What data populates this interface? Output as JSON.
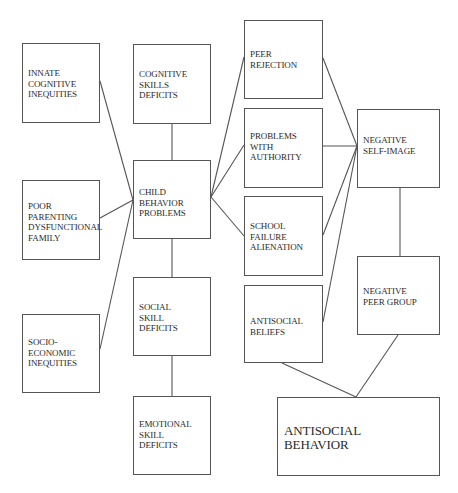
{
  "diagram": {
    "title": "",
    "line_color": "#555555",
    "text_color": "#2a2a2a",
    "nodes": [
      {
        "id": "innate",
        "label": "INNATE\nCOGNITIVE\nINEQUITIES",
        "x": 22,
        "y": 43,
        "w": 78,
        "h": 80,
        "label_top": 24
      },
      {
        "id": "cognitive",
        "label": "COGNITIVE\nSKILLS\nDEFICITS",
        "x": 133,
        "y": 44,
        "w": 78,
        "h": 80,
        "label_top": 24
      },
      {
        "id": "child",
        "label": "CHILD\nBEHAVIOR\nPROBLEMS",
        "x": 133,
        "y": 160,
        "w": 78,
        "h": 79,
        "label_top": 26
      },
      {
        "id": "parenting",
        "label": "POOR\nPARENTING\nDYSFUNCTIONAL\nFAMILY",
        "x": 22,
        "y": 180,
        "w": 78,
        "h": 80,
        "label_top": 20
      },
      {
        "id": "social",
        "label": "SOCIAL\nSKILL\nDEFICITS",
        "x": 133,
        "y": 277,
        "w": 78,
        "h": 79,
        "label_top": 24
      },
      {
        "id": "socio",
        "label": "SOCIO-\nECONOMIC\nINEQUITIES",
        "x": 22,
        "y": 314,
        "w": 78,
        "h": 79,
        "label_top": 22
      },
      {
        "id": "emotional",
        "label": "EMOTIONAL\nSKILL\nDEFICITS",
        "x": 133,
        "y": 396,
        "w": 78,
        "h": 79,
        "label_top": 22
      },
      {
        "id": "peer_rejection",
        "label": "PEER\nREJECTION",
        "x": 244,
        "y": 20,
        "w": 79,
        "h": 79,
        "label_top": 28
      },
      {
        "id": "authority",
        "label": "PROBLEMS\nWITH\nAUTHORITY",
        "x": 244,
        "y": 108,
        "w": 79,
        "h": 80,
        "label_top": 22
      },
      {
        "id": "school",
        "label": "SCHOOL\nFAILURE\nALIENATION",
        "x": 244,
        "y": 196,
        "w": 79,
        "h": 80,
        "label_top": 24
      },
      {
        "id": "beliefs",
        "label": "ANTISOCIAL\nBELIEFS",
        "x": 244,
        "y": 285,
        "w": 79,
        "h": 78,
        "label_top": 30
      },
      {
        "id": "self_image",
        "label": "NEGATIVE\nSELF-IMAGE",
        "x": 357,
        "y": 109,
        "w": 83,
        "h": 79,
        "label_top": 25
      },
      {
        "id": "peer_group",
        "label": "NEGATIVE\nPEER GROUP",
        "x": 357,
        "y": 256,
        "w": 83,
        "h": 79,
        "label_top": 29
      },
      {
        "id": "behavior",
        "label": "ANTISOCIAL\nBEHAVIOR",
        "x": 277,
        "y": 397,
        "w": 163,
        "h": 79,
        "label_top": 26,
        "big": true
      }
    ],
    "edges": [
      {
        "from": "innate",
        "to": "child",
        "x1": 100,
        "y1": 81,
        "x2": 133,
        "y2": 200
      },
      {
        "from": "parenting",
        "to": "child",
        "x1": 100,
        "y1": 218,
        "x2": 133,
        "y2": 200
      },
      {
        "from": "socio",
        "to": "child",
        "x1": 100,
        "y1": 349,
        "x2": 133,
        "y2": 200
      },
      {
        "from": "cognitive",
        "to": "child",
        "x1": 172,
        "y1": 124,
        "x2": 172,
        "y2": 160
      },
      {
        "from": "child",
        "to": "social",
        "x1": 172,
        "y1": 239,
        "x2": 172,
        "y2": 277
      },
      {
        "from": "social",
        "to": "emotional",
        "x1": 172,
        "y1": 356,
        "x2": 172,
        "y2": 396
      },
      {
        "from": "child",
        "to": "peer_rejection",
        "x1": 211,
        "y1": 197,
        "x2": 244,
        "y2": 57
      },
      {
        "from": "child",
        "to": "authority",
        "x1": 211,
        "y1": 197,
        "x2": 244,
        "y2": 145
      },
      {
        "from": "child",
        "to": "school",
        "x1": 211,
        "y1": 197,
        "x2": 244,
        "y2": 236
      },
      {
        "from": "peer_rejection",
        "to": "self_image",
        "x1": 323,
        "y1": 58,
        "x2": 357,
        "y2": 146
      },
      {
        "from": "authority",
        "to": "self_image",
        "x1": 323,
        "y1": 146,
        "x2": 357,
        "y2": 146
      },
      {
        "from": "school",
        "to": "self_image",
        "x1": 323,
        "y1": 235,
        "x2": 357,
        "y2": 146
      },
      {
        "from": "beliefs",
        "to": "self_image",
        "x1": 323,
        "y1": 322,
        "x2": 357,
        "y2": 146
      },
      {
        "from": "self_image",
        "to": "peer_group",
        "x1": 400,
        "y1": 188,
        "x2": 400,
        "y2": 256
      },
      {
        "from": "beliefs",
        "to": "behavior",
        "x1": 282,
        "y1": 363,
        "x2": 356,
        "y2": 397
      },
      {
        "from": "peer_group",
        "to": "behavior",
        "x1": 398,
        "y1": 335,
        "x2": 356,
        "y2": 397
      }
    ]
  }
}
